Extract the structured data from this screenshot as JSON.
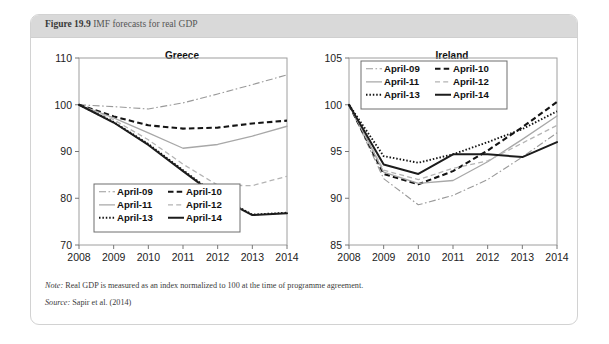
{
  "figure": {
    "number": "Figure 19.9",
    "title": "IMF forecasts for real GDP"
  },
  "footnotes": {
    "note_label": "Note:",
    "note_text": " Real GDP is measured as an index normalized to 100 at the time of programme agreement.",
    "source_label": "Source:",
    "source_text": " Sapir et al. (2014)"
  },
  "legend": {
    "entries": [
      {
        "label": "April-09",
        "style": "dash-dot",
        "color": "#9a9a9a",
        "width": 1.1
      },
      {
        "label": "April-10",
        "style": "dashed",
        "color": "#141414",
        "width": 2.1
      },
      {
        "label": "April-11",
        "style": "solid",
        "color": "#a8a8a8",
        "width": 1.3
      },
      {
        "label": "April-12",
        "style": "dashed-light",
        "color": "#b4b4b4",
        "width": 1.3
      },
      {
        "label": "April-13",
        "style": "dotted",
        "color": "#141414",
        "width": 1.9
      },
      {
        "label": "April-14",
        "style": "solid-bold",
        "color": "#1c1c1c",
        "width": 2.0
      }
    ]
  },
  "chart_data": [
    {
      "type": "line",
      "title": "Greece",
      "xlabel": "",
      "ylabel": "",
      "x": [
        2008,
        2009,
        2010,
        2011,
        2012,
        2013,
        2014
      ],
      "xlim": [
        2008,
        2014
      ],
      "ylim": [
        70,
        110
      ],
      "yticks": [
        70,
        80,
        90,
        100,
        110
      ],
      "xticks": [
        "2008",
        "2009",
        "2010",
        "2011",
        "2012",
        "2013",
        "2014"
      ],
      "grid": false,
      "legend_position": "lower-left",
      "series": [
        {
          "name": "April-09",
          "values": [
            100.0,
            99.6,
            99.1,
            100.4,
            102.3,
            104.3,
            106.4
          ]
        },
        {
          "name": "April-10",
          "values": [
            100.0,
            97.5,
            95.6,
            94.9,
            95.1,
            96.0,
            96.6
          ]
        },
        {
          "name": "April-11",
          "values": [
            100.0,
            97.2,
            94.0,
            90.7,
            91.5,
            93.3,
            95.4
          ]
        },
        {
          "name": "April-12",
          "values": [
            100.0,
            96.8,
            92.5,
            87.3,
            82.8,
            82.7,
            84.7
          ]
        },
        {
          "name": "April-13",
          "values": [
            100.0,
            96.3,
            91.6,
            86.0,
            80.5,
            76.5,
            76.9
          ]
        },
        {
          "name": "April-14",
          "values": [
            100.0,
            96.2,
            91.4,
            85.8,
            80.3,
            76.4,
            76.8
          ]
        }
      ]
    },
    {
      "type": "line",
      "title": "Ireland",
      "xlabel": "",
      "ylabel": "",
      "x": [
        2008,
        2009,
        2010,
        2011,
        2012,
        2013,
        2014
      ],
      "xlim": [
        2008,
        2014
      ],
      "ylim": [
        85,
        105
      ],
      "yticks": [
        85,
        90,
        95,
        100,
        105
      ],
      "xticks": [
        "2008",
        "2009",
        "2010",
        "2011",
        "2012",
        "2013",
        "2014"
      ],
      "grid": false,
      "legend_position": "upper-center",
      "series": [
        {
          "name": "April-09",
          "values": [
            100.0,
            92.1,
            89.3,
            90.3,
            92.0,
            94.4,
            97.0
          ]
        },
        {
          "name": "April-10",
          "values": [
            100.0,
            92.6,
            91.5,
            92.9,
            95.1,
            97.6,
            100.3
          ]
        },
        {
          "name": "April-11",
          "values": [
            100.0,
            92.8,
            91.6,
            91.9,
            93.9,
            96.3,
            98.8
          ]
        },
        {
          "name": "April-12",
          "values": [
            100.0,
            93.0,
            92.0,
            93.2,
            94.0,
            95.9,
            97.8
          ]
        },
        {
          "name": "April-13",
          "values": [
            100.0,
            94.5,
            93.8,
            94.7,
            96.0,
            97.4,
            99.3
          ]
        },
        {
          "name": "April-14",
          "values": [
            100.0,
            93.6,
            92.6,
            94.7,
            94.7,
            94.4,
            96.0
          ]
        }
      ]
    }
  ]
}
